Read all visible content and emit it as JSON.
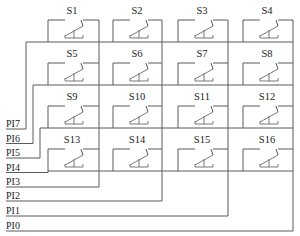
{
  "diagram": {
    "type": "4x4 keypad switch matrix",
    "switches": [
      [
        "S1",
        "S2",
        "S3",
        "S4"
      ],
      [
        "S5",
        "S6",
        "S7",
        "S8"
      ],
      [
        "S9",
        "S10",
        "S11",
        "S12"
      ],
      [
        "S13",
        "S14",
        "S15",
        "S16"
      ]
    ],
    "row_pins": [
      "PI7",
      "PI6",
      "PI5",
      "PI4"
    ],
    "column_pins": [
      "PI3",
      "PI2",
      "PI1",
      "PI0"
    ],
    "pin_labels_top_to_bottom": [
      "PI7",
      "PI6",
      "PI5",
      "PI4",
      "PI3",
      "PI2",
      "PI1",
      "PI0"
    ],
    "connections": {
      "PI7": "row 1 (S1-S4)",
      "PI6": "row 2 (S5-S8)",
      "PI5": "row 3 (S9-S12)",
      "PI4": "row 4 (S13-S16)",
      "PI3": "column 1 (S1,S5,S9,S13)",
      "PI2": "column 2 (S2,S6,S10,S14)",
      "PI1": "column 3 (S3,S7,S11,S15)",
      "PI0": "column 4 (S4,S8,S12,S16)"
    },
    "colors": {
      "wire": "#5a5a5a",
      "text": "#222222",
      "background": "#ffffff"
    }
  }
}
